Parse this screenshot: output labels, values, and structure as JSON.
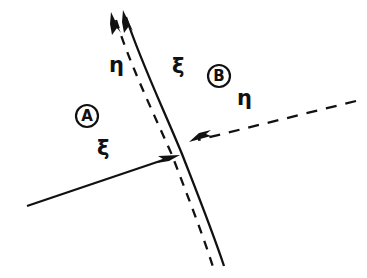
{
  "figure": {
    "background_color": "#ffffff",
    "ink_color": "#111111",
    "width": 367,
    "height": 278
  },
  "regions": [
    {
      "id": "A",
      "label": "A",
      "position": {
        "x": 74,
        "y": 103
      },
      "description": "left region"
    },
    {
      "id": "B",
      "label": "B",
      "position": {
        "x": 206,
        "y": 63
      },
      "description": "right region"
    }
  ],
  "labels": [
    {
      "id": "eta-upper-left",
      "text": "η",
      "symbol_name": "eta",
      "position": {
        "x": 109,
        "y": 55
      }
    },
    {
      "id": "xi-upper-middle",
      "text": "ξ",
      "symbol_name": "xi",
      "position": {
        "x": 172,
        "y": 56
      }
    },
    {
      "id": "eta-right",
      "text": "η",
      "symbol_name": "eta",
      "position": {
        "x": 237,
        "y": 88
      }
    },
    {
      "id": "xi-lower-left",
      "text": "ξ",
      "symbol_name": "xi",
      "position": {
        "x": 97,
        "y": 138
      }
    }
  ],
  "curves": [
    {
      "id": "xi-curve-solid",
      "style": "solid",
      "stroke_width": 2.3,
      "description": "solid curved coordinate line running from top-left arrow down to bottom-right",
      "path": "M 126 17 C 140 60, 163 108, 182 154 C 196 190, 212 230, 224 266"
    },
    {
      "id": "eta-curve-dashed",
      "style": "dashed",
      "stroke_width": 2.3,
      "dash_pattern": "9 8",
      "description": "dashed curved coordinate line just left of the solid curve",
      "path": "M 116 20 C 129 62, 152 110, 172 155 C 186 192, 202 232, 214 270"
    },
    {
      "id": "xi-line-solid-lower-left",
      "style": "solid",
      "stroke_width": 2.3,
      "description": "straight solid line entering from lower-left with arrow at the interface",
      "path": "M 27 206 L 176 156"
    },
    {
      "id": "eta-line-dashed-right",
      "style": "dashed",
      "stroke_width": 2.3,
      "dash_pattern": "11 9",
      "description": "straight dashed line entering from upper-right with arrow at the interface",
      "path": "M 356 101 L 191 142"
    }
  ],
  "arrows": [
    {
      "id": "arrow-eta-top",
      "belongs_to": "eta-curve-dashed",
      "direction": "up-left",
      "tip": {
        "x": 112,
        "y": 13
      }
    },
    {
      "id": "arrow-xi-top",
      "belongs_to": "xi-curve-solid",
      "direction": "up-left",
      "tip": {
        "x": 124,
        "y": 11
      }
    },
    {
      "id": "arrow-xi-interface",
      "belongs_to": "xi-line-solid-lower-left",
      "direction": "right",
      "tip": {
        "x": 179,
        "y": 155
      }
    },
    {
      "id": "arrow-eta-interface",
      "belongs_to": "eta-line-dashed-right",
      "direction": "left",
      "tip": {
        "x": 190,
        "y": 142
      }
    }
  ]
}
